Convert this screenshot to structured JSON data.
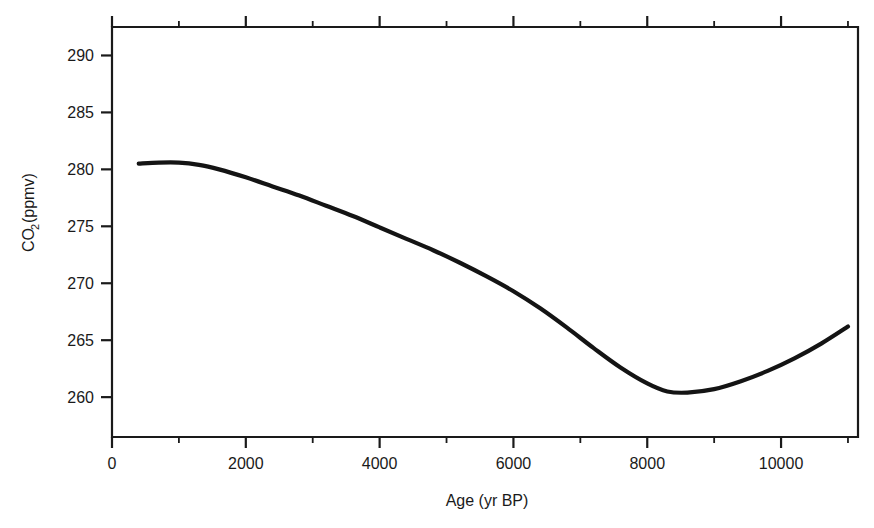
{
  "chart_data": {
    "type": "line",
    "title": "",
    "xlabel": "Age (yr BP)",
    "ylabel": "CO2(ppmv)",
    "ylabel_main": "CO",
    "ylabel_sub": "2",
    "ylabel_rest": "(ppmv)",
    "xlim": [
      0,
      11150
    ],
    "ylim": [
      256.5,
      292.5
    ],
    "grid": false,
    "legend": null,
    "xticks": [
      0,
      2000,
      4000,
      6000,
      8000,
      10000
    ],
    "xtick_labels": [
      "0",
      "2000",
      "4000",
      "6000",
      "8000",
      "10000"
    ],
    "xticks_minor": [
      1000,
      3000,
      5000,
      7000,
      9000,
      11000
    ],
    "yticks": [
      260,
      265,
      270,
      275,
      280,
      285,
      290
    ],
    "ytick_labels": [
      "260",
      "265",
      "270",
      "275",
      "280",
      "285",
      "290"
    ],
    "series": [
      {
        "name": "CO2",
        "x": [
          400,
          700,
          1000,
          1300,
          1600,
          2000,
          2400,
          2800,
          3200,
          3600,
          4000,
          4400,
          4800,
          5200,
          5600,
          6000,
          6400,
          6800,
          7200,
          7600,
          8000,
          8300,
          8600,
          9000,
          9400,
          9800,
          10200,
          10600,
          11000
        ],
        "y": [
          280.5,
          280.6,
          280.6,
          280.4,
          280.0,
          279.3,
          278.5,
          277.7,
          276.8,
          275.9,
          274.9,
          273.9,
          272.9,
          271.8,
          270.6,
          269.3,
          267.8,
          266.1,
          264.3,
          262.6,
          261.2,
          260.5,
          260.4,
          260.7,
          261.4,
          262.3,
          263.4,
          264.7,
          266.2
        ]
      }
    ]
  },
  "axes": {
    "x_title": "Age (yr BP)",
    "y_title_main": "CO",
    "y_title_sub": "2",
    "y_title_rest": "(ppmv)"
  }
}
